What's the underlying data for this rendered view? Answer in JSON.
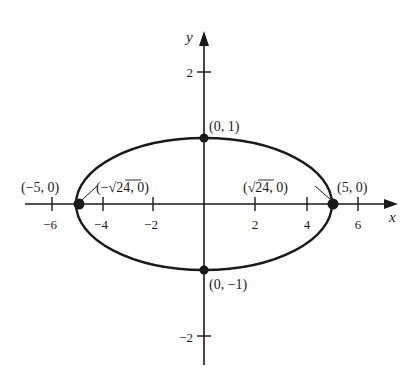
{
  "diagram": {
    "type": "ellipse-graph",
    "axes": {
      "x_label": "x",
      "y_label": "y",
      "x_ticks": [
        {
          "value": -6,
          "label": "−6"
        },
        {
          "value": -4,
          "label": "−4"
        },
        {
          "value": -2,
          "label": "−2"
        },
        {
          "value": 2,
          "label": "2"
        },
        {
          "value": 4,
          "label": "4"
        },
        {
          "value": 6,
          "label": "6"
        }
      ],
      "y_ticks": [
        {
          "value": 2,
          "label": "2"
        },
        {
          "value": 1,
          "label": "1"
        },
        {
          "value": -1,
          "label": "1"
        },
        {
          "value": -2,
          "label": "−2"
        }
      ]
    },
    "ellipse": {
      "center": [
        0,
        0
      ],
      "semi_major_x": 5,
      "semi_minor_y": 1
    },
    "points": [
      {
        "name": "top-vertex",
        "label": "(0, 1)"
      },
      {
        "name": "bottom-vertex",
        "label": "(0, −1)"
      },
      {
        "name": "left-vertex",
        "label": "(−5, 0)"
      },
      {
        "name": "right-vertex",
        "label": "(5, 0)"
      },
      {
        "name": "left-focus",
        "label_prefix": "(−",
        "label_radicand": "24",
        "label_suffix": ", 0)"
      },
      {
        "name": "right-focus",
        "label_prefix": "(",
        "label_radicand": "24",
        "label_suffix": ", 0)"
      }
    ],
    "color": "#1a1a1a"
  }
}
